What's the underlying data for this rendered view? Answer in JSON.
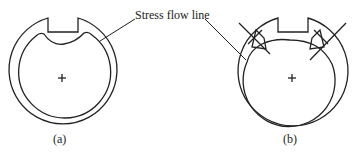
{
  "annotation": {
    "stress_flow_line": "Stress flow line"
  },
  "captions": {
    "a": "(a)",
    "b": "(b)"
  },
  "center_mark": "+"
}
